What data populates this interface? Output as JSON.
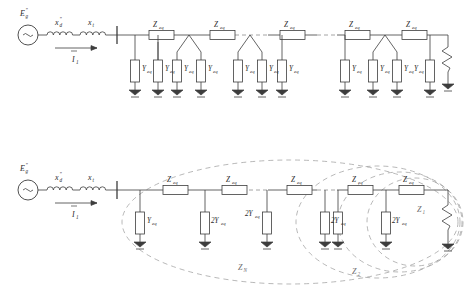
{
  "figure": {
    "labels": {
      "source_emf": "E",
      "source_emf_sub": "g",
      "source_emf_sup": "\"",
      "subtrans_react": "x",
      "subtrans_react_sub": "d",
      "subtrans_react_sup": "\"",
      "transformer_react": "x",
      "transformer_react_sub": "t",
      "current": "I",
      "current_sub": "1",
      "series_impedance": "Z",
      "series_impedance_sub": "eq",
      "shunt_admittance": "Y",
      "shunt_admittance_sub": "eq",
      "shunt_admittance_double": "2Y",
      "shunt_admittance_double_sub": "eq",
      "zone_n": "Z",
      "zone_n_sub": "N",
      "zone_2": "Z",
      "zone_2_sub": "2",
      "zone_1": "Z",
      "zone_1_sub": "1"
    },
    "colors": {
      "wire": "#3d3d3d",
      "dashed_wire": "#8e8e8e",
      "grouping_ellipse": "#9a9a9a",
      "box_fill": "#ffffff",
      "background": "#ffffff"
    },
    "diagrams": [
      {
        "id": "top-circuit",
        "name": "detailed-ladder-network",
        "description": "Source with subtransient reactance and transformer reactance feeding a ladder of Z_eq series branches with Y_eq shunt branches, several nodes split into two Y_eq legs",
        "series_count": 5,
        "shunt_count": 11,
        "shunt_label": "Y_eq",
        "terminates_in": "zigzag-load-to-ground"
      },
      {
        "id": "bottom-circuit",
        "name": "reduced-ladder-network",
        "description": "Same source feeding a reduced ladder: first shunt is Y_eq, remaining shunts are 2Y_eq; nested dashed ellipses mark driving point impedances Z_N, Z_2, Z_1",
        "series_count": 5,
        "shunt_count": 7,
        "first_shunt_label": "Y_eq",
        "other_shunt_label": "2Y_eq",
        "zones": [
          "Z_N",
          "Z_2",
          "Z_1"
        ],
        "terminates_in": "zigzag-load-to-ground"
      }
    ]
  }
}
